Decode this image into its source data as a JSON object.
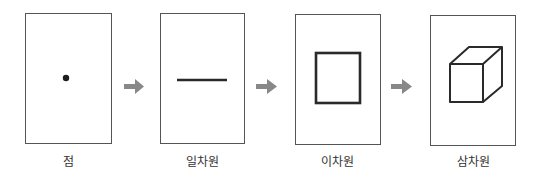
{
  "diagram": {
    "stages": [
      {
        "label": "점",
        "shape": "dot"
      },
      {
        "label": "일차원",
        "shape": "line"
      },
      {
        "label": "이차원",
        "shape": "square"
      },
      {
        "label": "삼차원",
        "shape": "cube"
      }
    ],
    "arrow_icon": "arrow-right-icon",
    "colors": {
      "stroke": "#2a2a2a",
      "arrow": "#888888",
      "panel_border": "#555555",
      "label": "#333333"
    }
  }
}
